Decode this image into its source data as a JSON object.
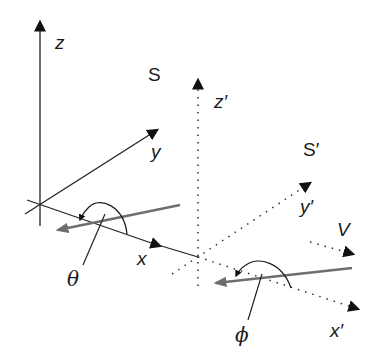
{
  "figure": {
    "colors": {
      "axis": "#1a1a1a",
      "ray": "#6e6e6e",
      "background": "#ffffff"
    }
  },
  "frame_S": {
    "name": "S",
    "axes": {
      "x": "x",
      "y": "y",
      "z": "z"
    },
    "angle_label": "θ",
    "line_style": "solid"
  },
  "frame_S_prime": {
    "name": "S′",
    "axes": {
      "x": "x′",
      "y": "y′",
      "z": "z′"
    },
    "angle_label": "ϕ",
    "line_style": "dotted",
    "velocity_label": "V"
  }
}
